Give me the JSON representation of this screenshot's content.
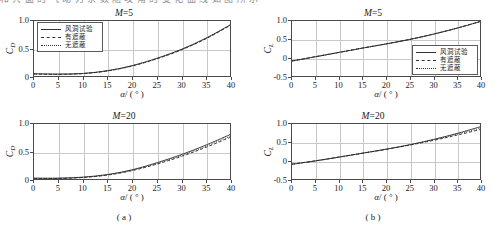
{
  "figure": {
    "top_clipped_text": "和 共 面 的 气 动 力 系 数 随 攻 角 的 变 化 曲 线 如 图 所 示",
    "caption_a": "( a )",
    "caption_b": "( b )"
  },
  "legend": {
    "entries": [
      {
        "label": "风洞试验",
        "style": "solid"
      },
      {
        "label": "有遮蔽",
        "style": "dash"
      },
      {
        "label": "无遮蔽",
        "style": "dot"
      }
    ]
  },
  "axis": {
    "xlabel_symbol": "α",
    "xlabel_unit": "/ ( ° )",
    "ylabel_cd": "C",
    "ylabel_cd_sub": "D",
    "ylabel_cl": "C",
    "ylabel_cl_sub": "L",
    "xticks": [
      "0",
      "5",
      "10",
      "15",
      "20",
      "25",
      "30",
      "35",
      "40"
    ],
    "yticks_cd": [
      "1.0",
      "0.5",
      "0"
    ],
    "yticks_cl": [
      "1.0",
      "0.5",
      "0",
      "-0.5"
    ]
  },
  "chart_data": [
    {
      "id": "panel-top-left",
      "type": "line",
      "title": "M=5",
      "title_symbol": "M",
      "title_value": "=5",
      "xlabel": "α/ ( ° )",
      "ylabel": "C_D",
      "xlim": [
        0,
        40
      ],
      "ylim": [
        0,
        1.0
      ],
      "xticks": [
        0,
        5,
        10,
        15,
        20,
        25,
        30,
        35,
        40
      ],
      "yticks": [
        0,
        0.5,
        1.0
      ],
      "grid": true,
      "legend_position": "upper-left",
      "x": [
        0,
        5,
        10,
        15,
        20,
        25,
        30,
        35,
        40
      ],
      "series": [
        {
          "name": "风洞试验",
          "style": "solid",
          "values": [
            0.075,
            0.068,
            0.08,
            0.13,
            0.22,
            0.35,
            0.51,
            0.71,
            0.95
          ]
        },
        {
          "name": "有遮蔽",
          "style": "dash",
          "values": [
            0.07,
            0.065,
            0.078,
            0.126,
            0.214,
            0.342,
            0.5,
            0.7,
            0.94
          ]
        },
        {
          "name": "无遮蔽",
          "style": "dot",
          "values": [
            0.072,
            0.066,
            0.079,
            0.128,
            0.218,
            0.348,
            0.508,
            0.708,
            0.948
          ]
        }
      ]
    },
    {
      "id": "panel-top-right",
      "type": "line",
      "title": "M=5",
      "title_symbol": "M",
      "title_value": "=5",
      "xlabel": "α/ ( ° )",
      "ylabel": "C_L",
      "xlim": [
        0,
        40
      ],
      "ylim": [
        -0.5,
        1.0
      ],
      "xticks": [
        0,
        5,
        10,
        15,
        20,
        25,
        30,
        35,
        40
      ],
      "yticks": [
        -0.5,
        0,
        0.5,
        1.0
      ],
      "grid": true,
      "legend_position": "lower-right",
      "x": [
        0,
        5,
        10,
        15,
        20,
        25,
        30,
        35,
        40
      ],
      "series": [
        {
          "name": "风洞试验",
          "style": "solid",
          "values": [
            -0.055,
            0.06,
            0.175,
            0.29,
            0.4,
            0.52,
            0.66,
            0.82,
            1.0
          ]
        },
        {
          "name": "有遮蔽",
          "style": "dash",
          "values": [
            -0.05,
            0.063,
            0.178,
            0.292,
            0.402,
            0.522,
            0.662,
            0.822,
            1.0
          ]
        },
        {
          "name": "无遮蔽",
          "style": "dot",
          "values": [
            -0.052,
            0.061,
            0.176,
            0.291,
            0.401,
            0.521,
            0.661,
            0.821,
            1.0
          ]
        }
      ]
    },
    {
      "id": "panel-bottom-left",
      "type": "line",
      "title": "M=20",
      "title_symbol": "M",
      "title_value": "=20",
      "xlabel": "α/ ( ° )",
      "ylabel": "C_D",
      "xlim": [
        0,
        40
      ],
      "ylim": [
        0,
        1.0
      ],
      "xticks": [
        0,
        5,
        10,
        15,
        20,
        25,
        30,
        35,
        40
      ],
      "yticks": [
        0,
        0.5,
        1.0
      ],
      "grid": true,
      "legend_position": "none",
      "x": [
        0,
        5,
        10,
        15,
        20,
        25,
        30,
        35,
        40
      ],
      "series": [
        {
          "name": "风洞试验",
          "style": "solid",
          "values": [
            0.05,
            0.05,
            0.068,
            0.115,
            0.2,
            0.325,
            0.47,
            0.64,
            0.83
          ]
        },
        {
          "name": "有遮蔽",
          "style": "dash",
          "values": [
            0.042,
            0.044,
            0.062,
            0.106,
            0.186,
            0.3,
            0.438,
            0.6,
            0.78
          ]
        },
        {
          "name": "无遮蔽",
          "style": "dot",
          "values": [
            0.046,
            0.047,
            0.065,
            0.11,
            0.193,
            0.312,
            0.452,
            0.618,
            0.8
          ]
        }
      ]
    },
    {
      "id": "panel-bottom-right",
      "type": "line",
      "title": "M=20",
      "title_symbol": "M",
      "title_value": "=20",
      "xlabel": "α/ ( ° )",
      "ylabel": "C_L",
      "xlim": [
        -0.5,
        1.0
      ],
      "ylim": [
        -0.5,
        1.0
      ],
      "xticks": [
        0,
        5,
        10,
        15,
        20,
        25,
        30,
        35,
        40
      ],
      "yticks": [
        -0.5,
        0,
        0.5,
        1.0
      ],
      "grid": true,
      "legend_position": "none",
      "x": [
        0,
        5,
        10,
        15,
        20,
        25,
        30,
        35,
        40
      ],
      "series": [
        {
          "name": "风洞试验",
          "style": "solid",
          "values": [
            -0.06,
            0.03,
            0.13,
            0.235,
            0.34,
            0.46,
            0.6,
            0.76,
            0.94
          ]
        },
        {
          "name": "有遮蔽",
          "style": "dash",
          "values": [
            -0.055,
            0.032,
            0.132,
            0.234,
            0.336,
            0.45,
            0.575,
            0.715,
            0.865
          ]
        },
        {
          "name": "无遮蔽",
          "style": "dot",
          "values": [
            -0.058,
            0.031,
            0.131,
            0.236,
            0.342,
            0.458,
            0.59,
            0.74,
            0.9
          ]
        }
      ]
    }
  ]
}
